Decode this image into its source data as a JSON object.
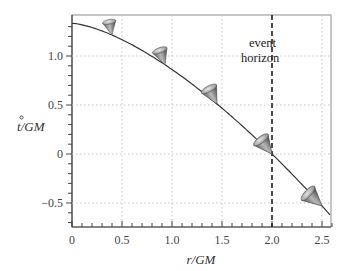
{
  "chart_data": {
    "type": "line",
    "title": "",
    "xlabel": "r/GM",
    "ylabel": "t̊/GM",
    "xlim": [
      0,
      2.6
    ],
    "ylim": [
      -0.75,
      1.4
    ],
    "xticks": [
      0,
      0.5,
      1.0,
      1.5,
      2.0,
      2.5
    ],
    "xtick_labels": [
      "0",
      "0.5",
      "1.0",
      "1.5",
      "2.0",
      "2.5"
    ],
    "yticks": [
      -0.5,
      0,
      0.5,
      1.0
    ],
    "ytick_labels": [
      "−0.5",
      "0",
      "0.5",
      "1.0"
    ],
    "grid": true,
    "legend": null,
    "series": [
      {
        "name": "infalling trajectory",
        "formula": "t/GM = (4/3)(1 - (r/2GM)^(3/2))",
        "x": [
          0,
          0.25,
          0.5,
          0.75,
          1.0,
          1.25,
          1.5,
          1.75,
          2.0,
          2.25,
          2.5,
          2.6
        ],
        "y": [
          1.333,
          1.274,
          1.167,
          1.027,
          0.862,
          0.675,
          0.467,
          0.241,
          0.0,
          -0.258,
          -0.53,
          -0.643
        ]
      }
    ],
    "light_cones": [
      {
        "r": 0.4,
        "tilt_deg": 12,
        "scale": 0.75
      },
      {
        "r": 0.93,
        "tilt_deg": 20,
        "scale": 0.85
      },
      {
        "r": 1.45,
        "tilt_deg": 28,
        "scale": 0.95
      },
      {
        "r": 2.0,
        "tilt_deg": 38,
        "scale": 1.0
      },
      {
        "r": 2.5,
        "tilt_deg": 48,
        "scale": 1.05
      }
    ],
    "annotations": [
      {
        "text": "event",
        "x": 1.9,
        "y": 1.22
      },
      {
        "text": "horizon",
        "x": 1.9,
        "y": 1.08
      }
    ],
    "vertical_line": {
      "x": 2.0,
      "style": "dashed",
      "label": "event horizon"
    }
  },
  "labels": {
    "xlabel": "r/GM",
    "ylabel_main": "t",
    "ylabel_rest": "/GM",
    "annot_line1": "event",
    "annot_line2": "horizon"
  }
}
